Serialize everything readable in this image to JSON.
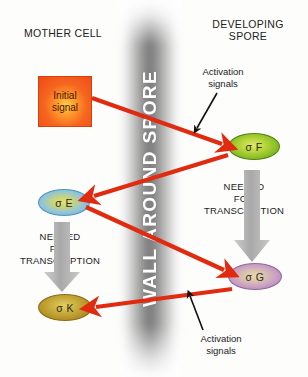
{
  "diagram": {
    "title_vertical": "WALL AROUND SPORE",
    "headings": {
      "left": "MOTHER CELL",
      "right": "DEVELOPING SPORE"
    },
    "initial_signal": {
      "label": "Initial signal",
      "line1": "Initial",
      "line2": "signal",
      "color": "#f5661f"
    },
    "sigma_factors": [
      {
        "id": "sigma-f",
        "label": "σ F",
        "compartment": "developing-spore",
        "color": "#86ba22"
      },
      {
        "id": "sigma-e",
        "label": "σ E",
        "compartment": "mother-cell",
        "color": "#59a6cf"
      },
      {
        "id": "sigma-g",
        "label": "σ G",
        "compartment": "developing-spore",
        "color": "#a06fa8"
      },
      {
        "id": "sigma-k",
        "label": "σ K",
        "compartment": "mother-cell",
        "color": "#b39024"
      }
    ],
    "needed_blocks": [
      {
        "id": "needed-right",
        "line1": "NEEDED",
        "line2": "FOR",
        "line3": "TRANSCRIPTION"
      },
      {
        "id": "needed-left",
        "line1": "NEEDED",
        "line2": "FOR",
        "line3": "TRANSCRIPTION"
      }
    ],
    "annotations": [
      {
        "id": "activation-top",
        "line1": "Activation",
        "line2": "signals"
      },
      {
        "id": "activation-bottom",
        "line1": "Activation",
        "line2": "signals"
      }
    ],
    "arrow_color": "#e02b10",
    "grey_arrow_color": "#b9b9b9",
    "annotation_arrow_color": "#111111",
    "red_arrows": [
      {
        "from": "initial-signal",
        "to": "sigma-f"
      },
      {
        "from": "sigma-f",
        "to": "sigma-e"
      },
      {
        "from": "sigma-e",
        "to": "sigma-g"
      },
      {
        "from": "sigma-g",
        "to": "sigma-k"
      }
    ]
  }
}
